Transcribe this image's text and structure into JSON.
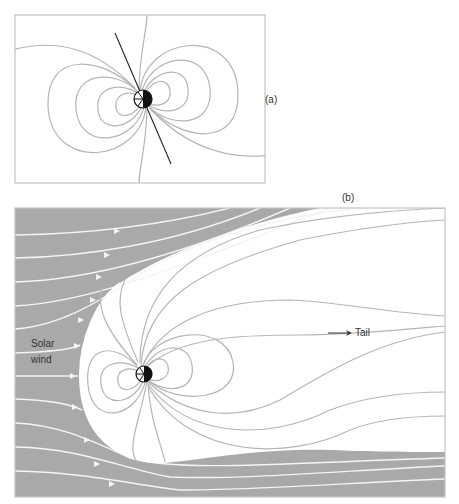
{
  "figure": {
    "panel_a": {
      "label": "(a)",
      "description": "Undisturbed dipole magnetic field of Earth with tilted axis"
    },
    "panel_b": {
      "label": "(b)",
      "description": "Magnetosphere compressed by the solar wind with extended tail",
      "annotations": {
        "solar_wind_line1": "Solar",
        "solar_wind_line2": "wind",
        "tail": "Tail"
      }
    },
    "colors": {
      "solar_wind_region": "#a9a9a9",
      "field_line": "#b5b5b5",
      "streamline": "#f4f4f4",
      "frame": "#c4c4c4",
      "earth_dark": "#111111"
    }
  }
}
